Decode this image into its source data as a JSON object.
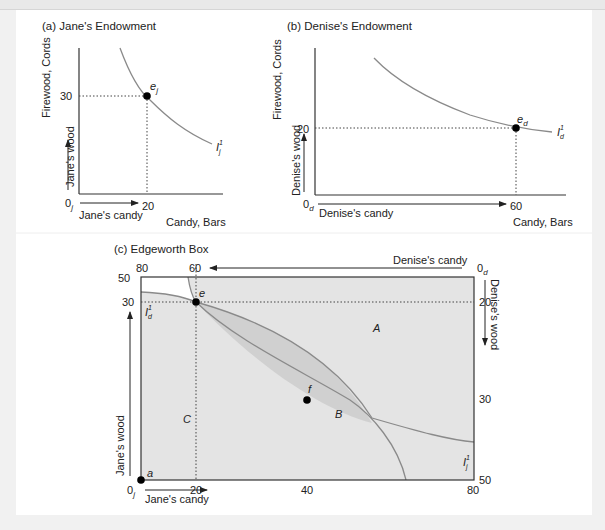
{
  "panels": {
    "a": {
      "title": "(a) Jane's Endowment",
      "ylabel": "Firewood, Cords",
      "xlabel": "Candy, Bars",
      "y_arrow_label": "Jane's wood",
      "x_arrow_label": "Jane's candy",
      "origin": "0",
      "origin_sub": "j",
      "y_tick": "30",
      "x_tick": "20",
      "point_label": "e",
      "point_sub": "j",
      "curve_label": "I",
      "curve_sup": "1",
      "curve_sub": "j"
    },
    "b": {
      "title": "(b) Denise's Endowment",
      "ylabel": "Firewood, Cords",
      "xlabel": "Candy, Bars",
      "y_arrow_label": "Denise's wood",
      "x_arrow_label": "Denise's candy",
      "origin": "0",
      "origin_sub": "d",
      "y_tick": "20",
      "x_tick": "60",
      "point_label": "e",
      "point_sub": "d",
      "curve_label": "I",
      "curve_sup": "1",
      "curve_sub": "d"
    },
    "c": {
      "title": "(c) Edgeworth Box",
      "top_left_tick": "80",
      "top_tick": "60",
      "top_arrow_label": "Denise's candy",
      "top_right_origin": "0",
      "top_right_origin_sub": "d",
      "right_arrow_label": "Denise's wood",
      "right_tick_20": "20",
      "right_tick_30": "30",
      "right_tick_50": "50",
      "left_tick_50": "50",
      "left_tick_30": "30",
      "left_arrow_label": "Jane's wood",
      "bottom_origin": "0",
      "bottom_origin_sub": "j",
      "bottom_arrow_label": "Jane's candy",
      "bottom_tick_20": "20",
      "bottom_tick_40": "40",
      "bottom_tick_80": "80",
      "region_A": "A",
      "region_B": "B",
      "region_C": "C",
      "point_e": "e",
      "point_f": "f",
      "point_a": "a",
      "curve_d_label": "I",
      "curve_d_sup": "1",
      "curve_d_sub": "d",
      "curve_j_label": "I",
      "curve_j_sup": "1",
      "curve_j_sub": "j"
    }
  },
  "colors": {
    "curve": "#8a8a8a",
    "shade": "#e4e4e4",
    "lens": "#d2d2d2",
    "axis": "#333333",
    "point": "#000000"
  }
}
